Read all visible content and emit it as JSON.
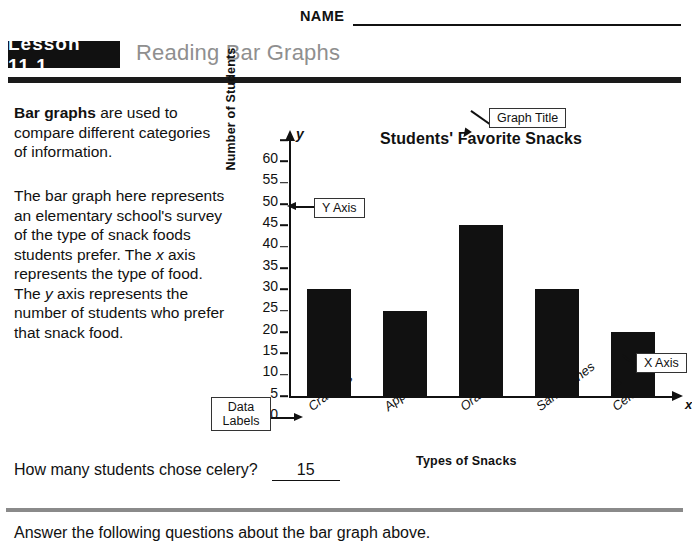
{
  "header": {
    "name_label": "NAME",
    "lesson_badge": "Lesson 11.1",
    "worksheet_title": "Reading Bar Graphs"
  },
  "intro": {
    "lead": "Bar graphs",
    "lead_rest": " are used to compare different categories of information.",
    "paragraph_2_a": "The bar graph here represents an elementary school's survey of the type of snack foods students prefer. The ",
    "var_x": "x",
    "paragraph_2_b": " axis represents the type of food. The ",
    "var_y": "y",
    "paragraph_2_c": " axis represents the number of students who prefer that snack food."
  },
  "callouts": {
    "graph_title": "Graph Title",
    "y_axis": "Y Axis",
    "x_axis": "X Axis",
    "data_labels": "Data Labels"
  },
  "axis_letters": {
    "y": "y",
    "x": "x"
  },
  "question": {
    "text": "How many students chose celery?",
    "answer": "15"
  },
  "footer": {
    "instruction": "Answer the following questions about the bar graph above."
  },
  "chart_data": {
    "type": "bar",
    "title": "Students' Favorite Snacks",
    "xlabel": "Types of Snacks",
    "ylabel": "Number of Students",
    "categories": [
      "Crackers",
      "Apples",
      "Oranges",
      "Sandwiches",
      "Celery"
    ],
    "values": [
      25,
      20,
      40,
      25,
      15
    ],
    "ylim": [
      0,
      60
    ],
    "ytick_step": 5,
    "yticks": [
      0,
      5,
      10,
      15,
      20,
      25,
      30,
      35,
      40,
      45,
      50,
      55,
      60
    ],
    "grid": false,
    "legend": false,
    "bar_color": "#111111"
  }
}
